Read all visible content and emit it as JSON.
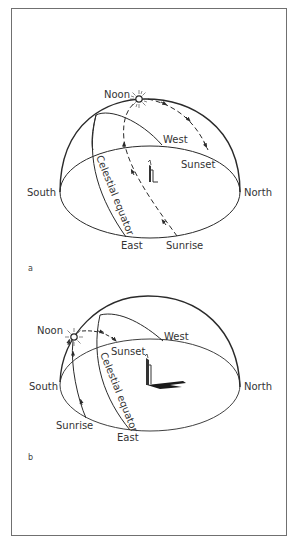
{
  "figure": {
    "panels": [
      {
        "id": "a",
        "panel_label": "a",
        "labels": {
          "noon": "Noon",
          "west": "West",
          "sunset": "Sunset",
          "south": "South",
          "north": "North",
          "east": "East",
          "sunrise": "Sunrise",
          "celestial_equator": "Celestial equator"
        }
      },
      {
        "id": "b",
        "panel_label": "b",
        "labels": {
          "noon": "Noon",
          "west": "West",
          "sunset": "Sunset",
          "south": "South",
          "north": "North",
          "east": "East",
          "sunrise": "Sunrise",
          "celestial_equator": "Celestial equator"
        }
      }
    ]
  },
  "colors": {
    "line": "#2a2a2a",
    "border": "#707070",
    "background": "#ffffff"
  }
}
